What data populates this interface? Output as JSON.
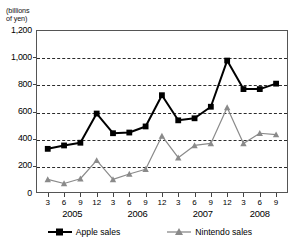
{
  "axis": {
    "unit_caption": "(billions\nof yen)",
    "y_ticks": [
      "1,200",
      "1,000",
      "800",
      "600",
      "400",
      "200",
      "0"
    ],
    "y_values": [
      1200,
      1000,
      800,
      600,
      400,
      200,
      0
    ],
    "y_min": 0,
    "y_max": 1200,
    "x_month_labels": [
      "3",
      "6",
      "9",
      "12",
      "3",
      "6",
      "9",
      "12",
      "3",
      "6",
      "9",
      "12",
      "3",
      "6",
      "9"
    ],
    "x_year_labels": [
      "2005",
      "2006",
      "2007",
      "2008"
    ]
  },
  "legend": {
    "items": [
      {
        "label": "Apple sales",
        "marker": "filled-square-marker",
        "color": "#000000"
      },
      {
        "label": "Nintendo sales",
        "marker": "triangle-marker",
        "color": "#8a8a8a"
      }
    ]
  },
  "colors": {
    "apple": "#000000",
    "nintendo": "#8a8a8a",
    "grid": "#2b2b2b",
    "frame": "#555555"
  },
  "chart_data": {
    "type": "line",
    "title": "",
    "subtitle": "",
    "xlabel": "",
    "ylabel": "(billions of yen)",
    "ylim": [
      0,
      1200
    ],
    "grid": true,
    "legend_position": "bottom",
    "categories": [
      "2005-3",
      "2005-6",
      "2005-9",
      "2005-12",
      "2006-3",
      "2006-6",
      "2006-9",
      "2006-12",
      "2007-3",
      "2007-6",
      "2007-9",
      "2007-12",
      "2008-3",
      "2008-6",
      "2008-9"
    ],
    "series": [
      {
        "name": "Apple sales",
        "color": "#000000",
        "marker": "square",
        "values": [
          325,
          350,
          370,
          585,
          440,
          445,
          490,
          720,
          535,
          550,
          635,
          975,
          765,
          765,
          805
        ]
      },
      {
        "name": "Nintendo sales",
        "color": "#8a8a8a",
        "marker": "triangle",
        "values": [
          100,
          70,
          105,
          240,
          100,
          140,
          175,
          420,
          260,
          350,
          365,
          630,
          365,
          440,
          430
        ]
      }
    ]
  }
}
